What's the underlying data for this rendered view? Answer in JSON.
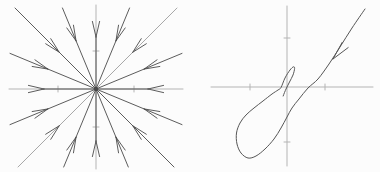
{
  "figure": {
    "width": 380,
    "height": 172,
    "background": "#fcfcfc",
    "ink_color": "#4a4a4a",
    "light_ink_color": "#9e9e9e",
    "axis_color": "#b4b4b4",
    "trajectory_color": "#565656"
  },
  "star_plot": {
    "center": {
      "x": 96,
      "y": 89
    },
    "clip_box": {
      "x_min": 10,
      "x_max": 182,
      "y_min": 8,
      "y_max": 167
    },
    "x_axis": {
      "y": 89,
      "x1": 9,
      "x2": 183,
      "ticks_x": [
        58,
        134
      ],
      "tick_len": 3
    },
    "y_axis": {
      "x": 96,
      "y1": 5,
      "y2": 169,
      "ticks_y": [
        51,
        127
      ],
      "tick_len": 3
    },
    "ray_angles_deg": [
      0,
      22.5,
      45,
      67.5,
      90,
      112.5,
      135,
      157.5,
      180,
      202.5,
      225,
      247.5,
      270,
      292.5,
      315,
      337.5
    ],
    "light_ray_angles_deg": [
      45,
      225
    ],
    "axis_ray_angles_deg": [
      0,
      90,
      180,
      270
    ],
    "arrow": {
      "tip_radius": 52,
      "wing_length": 16,
      "half_angle_deg": 13
    },
    "center_dot_radius": 2.2
  },
  "spiral_plot": {
    "origin": {
      "x": 287,
      "y": 87
    },
    "x_axis": {
      "y": 87,
      "x1": 211,
      "x2": 373,
      "ticks_x": [
        250,
        325
      ],
      "tick_len": 3
    },
    "y_axis": {
      "x": 287,
      "y1": 6,
      "y2": 166,
      "ticks_y": [
        38,
        142
      ],
      "tick_len": 3
    },
    "trajectory": [
      [
        365,
        9
      ],
      [
        352,
        28
      ],
      [
        340,
        47
      ],
      [
        329,
        64
      ],
      [
        318,
        79
      ],
      [
        308,
        88
      ],
      [
        299,
        99
      ],
      [
        292,
        108
      ],
      [
        287,
        117
      ],
      [
        281,
        128
      ],
      [
        274,
        139
      ],
      [
        265,
        149
      ],
      [
        256,
        156
      ],
      [
        248,
        158
      ],
      [
        241,
        153
      ],
      [
        237,
        144
      ],
      [
        236.5,
        133
      ],
      [
        240,
        123
      ],
      [
        246,
        115
      ],
      [
        254,
        108
      ],
      [
        263,
        101
      ],
      [
        272,
        94
      ],
      [
        278,
        90
      ],
      [
        281,
        87.5
      ],
      [
        285,
        78
      ],
      [
        290,
        70
      ],
      [
        293.5,
        66.8
      ],
      [
        294.6,
        68.5
      ],
      [
        293,
        75
      ],
      [
        289.5,
        82
      ],
      [
        286.5,
        88
      ],
      [
        284.5,
        92.5
      ],
      [
        283.2,
        96
      ]
    ],
    "arrow": {
      "tip": [
        333,
        59
      ],
      "back_angle_deg": 57,
      "wing_length": 19,
      "wing_offsets_deg": [
        4,
        -20
      ]
    }
  }
}
